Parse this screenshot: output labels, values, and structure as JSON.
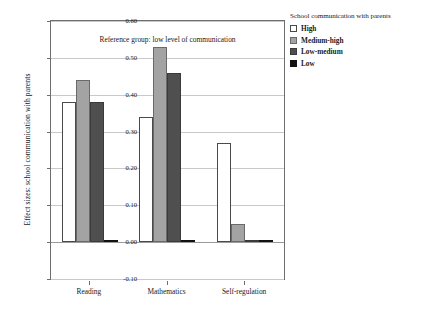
{
  "chart_data": {
    "type": "bar",
    "title": "",
    "annotation": "Reference group: low level of communication",
    "xlabel": "",
    "ylabel": "Effect sizes: school communication with parents",
    "categories": [
      "Reading",
      "Mathematics",
      "Self-regulation"
    ],
    "series": [
      {
        "name": "High",
        "values": [
          0.38,
          0.34,
          0.27
        ],
        "color": "#ffffff"
      },
      {
        "name": "Medium-high",
        "values": [
          0.44,
          0.53,
          0.05
        ],
        "color": "#a3a3a3"
      },
      {
        "name": "Low-medium",
        "values": [
          0.38,
          0.46,
          0.0
        ],
        "color": "#4f4f4f"
      },
      {
        "name": "Low",
        "values": [
          0.0,
          0.0,
          0.0
        ],
        "color": "#121212"
      }
    ],
    "ylim": [
      -0.1,
      0.6
    ],
    "yticks": [
      0.6,
      0.5,
      0.4,
      0.3,
      0.2,
      0.1,
      0.0,
      -0.1
    ],
    "ytick_labels": [
      "0.60",
      "0.50",
      "0.40",
      "0.30",
      "0.20",
      "0.10",
      "0.00",
      "-0.10"
    ],
    "grid": true,
    "legend_position": "right",
    "legend_title": "School communication with parents"
  },
  "legend": {
    "title": "School communication with parents",
    "items": [
      {
        "label": "High"
      },
      {
        "label": "Medium-high"
      },
      {
        "label": "Low-medium"
      },
      {
        "label": "Low"
      }
    ]
  }
}
